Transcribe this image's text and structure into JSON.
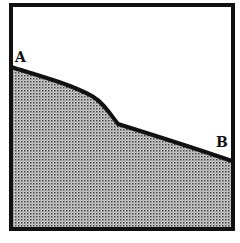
{
  "diagram": {
    "type": "cross-section profile",
    "frame": {
      "x": 10,
      "y": 4,
      "width": 223,
      "height": 225,
      "stroke": "#111111",
      "stroke_width": 4
    },
    "fill": {
      "pattern": "stipple dots",
      "background": "#d8d8d8",
      "dot_color": "#333333"
    },
    "profile_line": {
      "stroke": "#111111",
      "stroke_width": 4,
      "path": "M 11 67 C 40 76, 70 84, 92 96 C 104 103, 110 114, 118 124 C 150 134, 200 150, 232 161"
    },
    "labels": {
      "start": "A",
      "end": "B"
    }
  }
}
